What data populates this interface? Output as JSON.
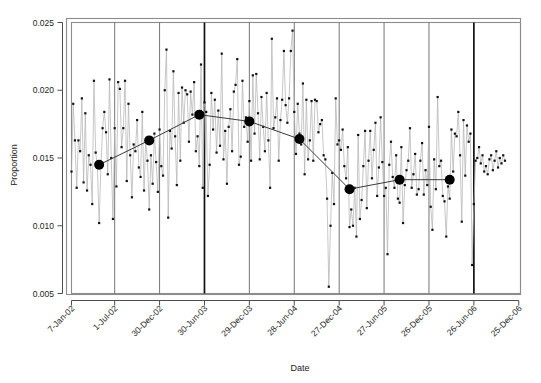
{
  "chart_data": {
    "type": "line",
    "title": "",
    "xlabel": "Date",
    "ylabel": "Proportion",
    "ylim": [
      0.005,
      0.025
    ],
    "yticks": [
      0.005,
      0.01,
      0.015,
      0.02,
      0.025
    ],
    "ytick_labels": [
      "0.005",
      "0.010",
      "0.015",
      "0.020",
      "0.025"
    ],
    "grid": false,
    "legend": "none",
    "xtick_labels": [
      "7-Jan-02",
      "1-Jul-02",
      "30-Dec-02",
      "30-Jun-03",
      "29-Dec-03",
      "28-Jun-04",
      "27-Dec-04",
      "27-Jun-05",
      "26-Dec-05",
      "26-Jun-06",
      "25-Dec-06"
    ],
    "xtick_index": [
      0,
      25,
      51,
      77,
      103,
      129,
      155,
      181,
      207,
      233,
      259
    ],
    "n_points": 261,
    "x_start_label": "7-Jan-02",
    "x_end_label": "25-Dec-06",
    "series": [
      {
        "name": "Weekly proportion",
        "marker": "filled-square-small",
        "line_color": "#b4b4b4",
        "marker_color": "#111111",
        "values": [
          0.014,
          0.019,
          0.0163,
          0.0128,
          0.0163,
          0.0155,
          0.0194,
          0.0132,
          0.0183,
          0.0126,
          0.0152,
          0.0145,
          0.0116,
          0.0207,
          0.0154,
          0.0143,
          0.0102,
          0.0143,
          0.0172,
          0.0184,
          0.0169,
          0.0138,
          0.0208,
          0.015,
          0.0105,
          0.0172,
          0.0129,
          0.0206,
          0.0201,
          0.0158,
          0.0172,
          0.0207,
          0.0133,
          0.019,
          0.0152,
          0.0121,
          0.016,
          0.0155,
          0.0178,
          0.0143,
          0.0136,
          0.0184,
          0.0126,
          0.0163,
          0.0148,
          0.0112,
          0.0152,
          0.0131,
          0.0168,
          0.0147,
          0.0125,
          0.0171,
          0.0144,
          0.0137,
          0.02,
          0.023,
          0.0106,
          0.017,
          0.0157,
          0.0214,
          0.0166,
          0.013,
          0.0198,
          0.0148,
          0.0202,
          0.0176,
          0.02,
          0.0197,
          0.0162,
          0.0199,
          0.0182,
          0.0206,
          0.0155,
          0.0166,
          0.0144,
          0.0219,
          0.0128,
          0.0191,
          0.0184,
          0.0122,
          0.0145,
          0.0198,
          0.0171,
          0.0193,
          0.0154,
          0.0185,
          0.0159,
          0.0227,
          0.0149,
          0.017,
          0.0131,
          0.0173,
          0.0186,
          0.0155,
          0.0199,
          0.0204,
          0.0223,
          0.0145,
          0.0151,
          0.0207,
          0.0173,
          0.018,
          0.0162,
          0.0192,
          0.0148,
          0.0211,
          0.0168,
          0.0212,
          0.0183,
          0.0149,
          0.0195,
          0.0173,
          0.0155,
          0.0198,
          0.0163,
          0.0128,
          0.0238,
          0.0172,
          0.018,
          0.0194,
          0.0148,
          0.0178,
          0.0193,
          0.0229,
          0.0189,
          0.0176,
          0.0194,
          0.0229,
          0.0244,
          0.0184,
          0.0153,
          0.019,
          0.0168,
          0.016,
          0.0205,
          0.0138,
          0.0193,
          0.0149,
          0.0163,
          0.0192,
          0.0148,
          0.0193,
          0.0192,
          0.0169,
          0.0175,
          0.0178,
          0.0152,
          0.0149,
          0.012,
          0.0055,
          0.01,
          0.0139,
          0.0116,
          0.0194,
          0.016,
          0.0163,
          0.0156,
          0.0171,
          0.0144,
          0.0135,
          0.0158,
          0.0099,
          0.0112,
          0.01,
          0.0128,
          0.0092,
          0.0167,
          0.0105,
          0.0119,
          0.0144,
          0.017,
          0.0113,
          0.0148,
          0.017,
          0.0135,
          0.0156,
          0.0176,
          0.0122,
          0.0143,
          0.018,
          0.0147,
          0.0122,
          0.0128,
          0.0079,
          0.0145,
          0.0162,
          0.0136,
          0.0128,
          0.0152,
          0.012,
          0.0117,
          0.0158,
          0.0102,
          0.013,
          0.0141,
          0.0148,
          0.0172,
          0.0128,
          0.0138,
          0.0153,
          0.0123,
          0.0127,
          0.0148,
          0.0161,
          0.0123,
          0.0141,
          0.013,
          0.0173,
          0.0114,
          0.0097,
          0.0149,
          0.0127,
          0.0195,
          0.0144,
          0.0148,
          0.0122,
          0.0118,
          0.0092,
          0.0129,
          0.012,
          0.0171,
          0.014,
          0.0168,
          0.0166,
          0.0184,
          0.0152,
          0.0103,
          0.0178,
          0.0137,
          0.0174,
          0.0162,
          0.0168,
          0.0071,
          0.0116,
          0.0148,
          0.015,
          0.0158,
          0.0146,
          0.0152,
          0.014,
          0.0144,
          0.0138,
          0.0149,
          0.0152,
          0.0141,
          0.0148,
          0.0155,
          0.0143,
          0.015,
          0.0146,
          0.0152,
          0.0148
        ]
      },
      {
        "name": "Period means",
        "marker": "filled-circle-large",
        "line_color": "#3a3a3a",
        "marker_color": "#000000",
        "x_index": [
          16,
          45,
          74,
          103,
          132,
          161,
          190,
          219
        ],
        "values": [
          0.0145,
          0.0163,
          0.0182,
          0.0177,
          0.0164,
          0.0127,
          0.0134,
          0.0134
        ]
      }
    ],
    "vertical_dividers": [
      {
        "x_index": 25,
        "weight": "thin"
      },
      {
        "x_index": 51,
        "weight": "thin"
      },
      {
        "x_index": 77,
        "weight": "bold"
      },
      {
        "x_index": 103,
        "weight": "thin"
      },
      {
        "x_index": 129,
        "weight": "thin"
      },
      {
        "x_index": 155,
        "weight": "thin"
      },
      {
        "x_index": 181,
        "weight": "thin"
      },
      {
        "x_index": 207,
        "weight": "thin"
      },
      {
        "x_index": 233,
        "weight": "bold"
      }
    ],
    "colors": {
      "frame": "#8c8c8c",
      "axis": "#4d4d4d",
      "series_line": "#b4b4b4",
      "series_marker": "#111111",
      "mean_line": "#3a3a3a",
      "mean_marker": "#000000",
      "divider_thin": "#666666",
      "divider_bold": "#111111",
      "background": "#ffffff"
    }
  }
}
